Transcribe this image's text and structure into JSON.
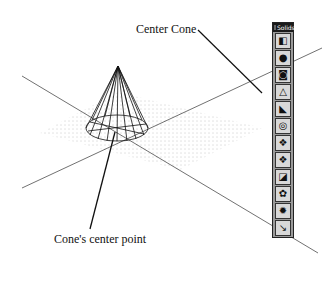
{
  "callouts": {
    "center_cone": "Center Cone",
    "center_point": "Cone's center point"
  },
  "toolbar": {
    "title": "Solids",
    "buttons": [
      {
        "name": "box",
        "glyph": "◧"
      },
      {
        "name": "sphere",
        "glyph": "●"
      },
      {
        "name": "cylinder",
        "glyph": "◙"
      },
      {
        "name": "cone",
        "glyph": "△"
      },
      {
        "name": "wedge",
        "glyph": "◣"
      },
      {
        "name": "torus",
        "glyph": "◎"
      },
      {
        "name": "extrude",
        "glyph": "❖"
      },
      {
        "name": "revolve",
        "glyph": "❖"
      },
      {
        "name": "slice",
        "glyph": "◪"
      },
      {
        "name": "section",
        "glyph": "✿"
      },
      {
        "name": "interference",
        "glyph": "✹"
      },
      {
        "name": "setup",
        "glyph": "↘"
      }
    ]
  }
}
